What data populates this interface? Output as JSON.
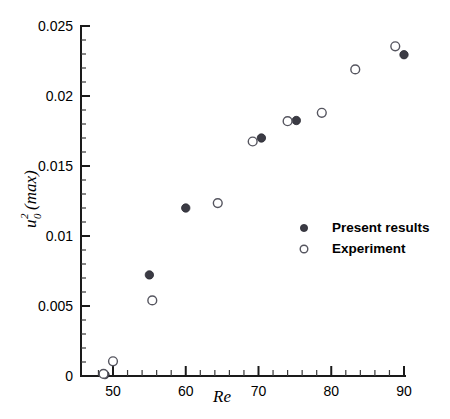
{
  "chart_data": {
    "type": "scatter",
    "title": "",
    "xlabel": "Re",
    "ylabel": "u_0^2 (max)",
    "ylabel_parts": {
      "base": "u",
      "sup": "2",
      "sub": "0",
      "tail": "(max)"
    },
    "xlim": [
      47.0,
      91.5
    ],
    "ylim": [
      0,
      0.025
    ],
    "grid": false,
    "legend_position": "center-right",
    "x_ticks": [
      50,
      60,
      70,
      80,
      90
    ],
    "x_tick_labels": [
      "50",
      "60",
      "70",
      "80",
      "90"
    ],
    "x_minor_step": 2,
    "y_ticks": [
      0,
      0.005,
      0.01,
      0.015,
      0.02,
      0.025
    ],
    "y_tick_labels": [
      "0",
      "0.005",
      "0.01",
      "0.015",
      "0.02",
      "0.025"
    ],
    "y_minor_step": 0.001,
    "series": [
      {
        "name": "Present results",
        "marker": "filled-circle",
        "color": "#3b3b44",
        "points": [
          {
            "x": 48.9,
            "y": 0.0001
          },
          {
            "x": 55.0,
            "y": 0.00722
          },
          {
            "x": 60.0,
            "y": 0.012
          },
          {
            "x": 70.4,
            "y": 0.017
          },
          {
            "x": 75.2,
            "y": 0.01825
          },
          {
            "x": 90.0,
            "y": 0.02295
          }
        ]
      },
      {
        "name": "Experiment",
        "marker": "open-circle",
        "color": "#55555f",
        "points": [
          {
            "x": 48.7,
            "y": 0.00015
          },
          {
            "x": 50.0,
            "y": 0.00105
          },
          {
            "x": 55.4,
            "y": 0.0054
          },
          {
            "x": 64.4,
            "y": 0.01235
          },
          {
            "x": 69.2,
            "y": 0.01675
          },
          {
            "x": 74.0,
            "y": 0.0182
          },
          {
            "x": 78.7,
            "y": 0.0188
          },
          {
            "x": 83.3,
            "y": 0.0219
          },
          {
            "x": 88.8,
            "y": 0.02355
          }
        ]
      }
    ]
  },
  "legend": {
    "entries": [
      {
        "label": "Present results",
        "marker": "filled-circle"
      },
      {
        "label": "Experiment",
        "marker": "open-circle"
      }
    ]
  }
}
